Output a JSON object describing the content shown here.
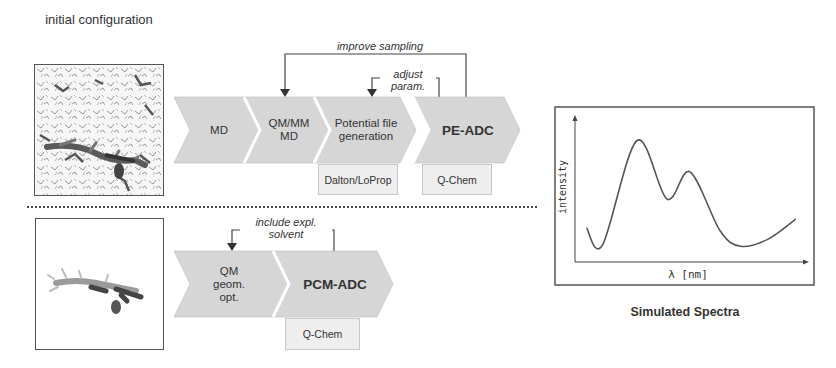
{
  "top_workflow": {
    "image_caption": "initial configuration",
    "image_alt": "solvated molecule snapshot",
    "steps": [
      {
        "label": "MD",
        "bold": false
      },
      {
        "label": "QM/MM MD",
        "bold": false
      },
      {
        "label": "Potential file generation",
        "bold": false
      },
      {
        "label": "PE-ADC",
        "bold": true
      }
    ],
    "tools": [
      {
        "step": "Potential file generation",
        "label": "Dalton/LoProp"
      },
      {
        "step": "PE-ADC",
        "label": "Q-Chem"
      }
    ],
    "feedback_loops": [
      {
        "label": "improve sampling",
        "from": "PE-ADC",
        "to": "QM/MM MD"
      },
      {
        "label": "adjust param.",
        "from": "PE-ADC",
        "to": "Potential file generation"
      }
    ]
  },
  "bottom_workflow": {
    "image_alt": "isolated molecule",
    "steps": [
      {
        "label": "QM geom. opt.",
        "bold": false
      },
      {
        "label": "PCM-ADC",
        "bold": true
      }
    ],
    "tools": [
      {
        "step": "PCM-ADC",
        "label": "Q-Chem"
      }
    ],
    "feedback_loops": [
      {
        "label": "include expl. solvent",
        "from": "PCM-ADC",
        "to": "QM geom. opt."
      }
    ]
  },
  "spectra": {
    "title": "Simulated Spectra",
    "xlabel": "λ [nm]",
    "ylabel": "intensity"
  },
  "colors": {
    "chevron_fill": "#d6d6d6",
    "tool_box_fill": "#eeeeee",
    "line": "#444444"
  },
  "chart_data": {
    "type": "line",
    "title": "Simulated Spectra",
    "xlabel": "λ [nm]",
    "ylabel": "intensity",
    "grid": false,
    "series": [
      {
        "name": "spectrum",
        "x": [
          0.05,
          0.12,
          0.27,
          0.4,
          0.5,
          0.63,
          0.72,
          0.84,
          0.96
        ],
        "y": [
          0.24,
          0.12,
          0.85,
          0.44,
          0.63,
          0.22,
          0.11,
          0.16,
          0.3
        ]
      }
    ],
    "xlim": [
      0,
      1
    ],
    "ylim": [
      0,
      1
    ]
  }
}
